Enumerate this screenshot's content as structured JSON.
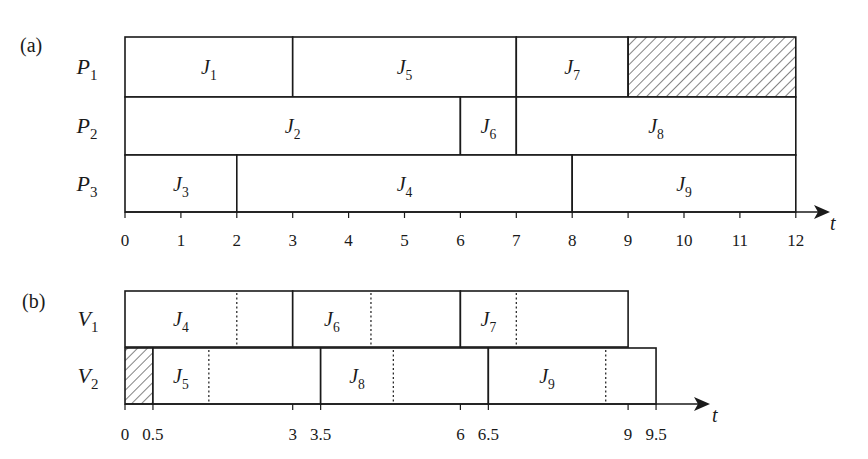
{
  "panel_a": {
    "label": "(a)",
    "axis_label": "t",
    "ticks": [
      "0",
      "1",
      "2",
      "3",
      "4",
      "5",
      "6",
      "7",
      "8",
      "9",
      "10",
      "11",
      "12"
    ],
    "rows": [
      {
        "name": "P",
        "sub": "1",
        "jobs": [
          {
            "name": "J",
            "sub": "1",
            "start": 0,
            "end": 3
          },
          {
            "name": "J",
            "sub": "5",
            "start": 3,
            "end": 7
          },
          {
            "name": "J",
            "sub": "7",
            "start": 7,
            "end": 9
          },
          {
            "name": "",
            "sub": "",
            "start": 9,
            "end": 12,
            "idle": true
          }
        ]
      },
      {
        "name": "P",
        "sub": "2",
        "jobs": [
          {
            "name": "J",
            "sub": "2",
            "start": 0,
            "end": 6
          },
          {
            "name": "J",
            "sub": "6",
            "start": 6,
            "end": 7
          },
          {
            "name": "J",
            "sub": "8",
            "start": 7,
            "end": 12
          }
        ]
      },
      {
        "name": "P",
        "sub": "3",
        "jobs": [
          {
            "name": "J",
            "sub": "3",
            "start": 0,
            "end": 2
          },
          {
            "name": "J",
            "sub": "4",
            "start": 2,
            "end": 8
          },
          {
            "name": "J",
            "sub": "9",
            "start": 8,
            "end": 12
          }
        ]
      }
    ]
  },
  "panel_b": {
    "label": "(b)",
    "axis_label": "t",
    "ticks": [
      {
        "v": 0,
        "label": "0"
      },
      {
        "v": 0.5,
        "label": "0.5"
      },
      {
        "v": 3,
        "label": "3"
      },
      {
        "v": 3.5,
        "label": "3.5"
      },
      {
        "v": 6,
        "label": "6"
      },
      {
        "v": 6.5,
        "label": "6.5"
      },
      {
        "v": 9,
        "label": "9"
      },
      {
        "v": 9.5,
        "label": "9.5"
      }
    ],
    "rows": [
      {
        "name": "V",
        "sub": "1",
        "jobs": [
          {
            "name": "J",
            "sub": "4",
            "start": 0,
            "end": 3,
            "split": 2
          },
          {
            "name": "J",
            "sub": "6",
            "start": 3,
            "end": 6,
            "split": 4.4
          },
          {
            "name": "J",
            "sub": "7",
            "start": 6,
            "end": 9,
            "split": 7
          }
        ]
      },
      {
        "name": "V",
        "sub": "2",
        "jobs": [
          {
            "name": "",
            "sub": "",
            "start": 0,
            "end": 0.5,
            "idle": true
          },
          {
            "name": "J",
            "sub": "5",
            "start": 0.5,
            "end": 3.5,
            "split": 1.5
          },
          {
            "name": "J",
            "sub": "8",
            "start": 3.5,
            "end": 6.5,
            "split": 4.8
          },
          {
            "name": "J",
            "sub": "9",
            "start": 6.5,
            "end": 9.5,
            "split": 8.6
          }
        ]
      }
    ]
  },
  "colors": {
    "ink": "#1a1a1a",
    "background": "#ffffff"
  }
}
